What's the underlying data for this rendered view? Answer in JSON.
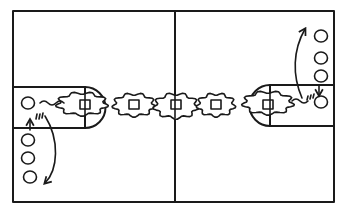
{
  "diagram": {
    "title": "",
    "type": "court-drill-diagram",
    "colors": {
      "ink": "#1a1a1a",
      "background": "#ffffff"
    },
    "court": {
      "halves": 2,
      "center_line": true
    },
    "keys": [
      {
        "side": "left",
        "label": ""
      },
      {
        "side": "right",
        "label": ""
      }
    ],
    "players": {
      "left_line": {
        "count": 4,
        "description": "player at baseline plus 3 waiting in line below"
      },
      "right_line": {
        "count": 4,
        "description": "player at baseline plus 3 waiting in line above"
      }
    },
    "chain": {
      "description": "weave of passing players (squares) with cloud-shaped movement zones across the court",
      "squares": 5
    },
    "arrows": [
      {
        "side": "left",
        "meaning": "pass / move from key down to end of line"
      },
      {
        "side": "left",
        "meaning": "next player steps up"
      },
      {
        "side": "right",
        "meaning": "pass / move from key up to end of line"
      },
      {
        "side": "right",
        "meaning": "next player steps down"
      }
    ]
  }
}
